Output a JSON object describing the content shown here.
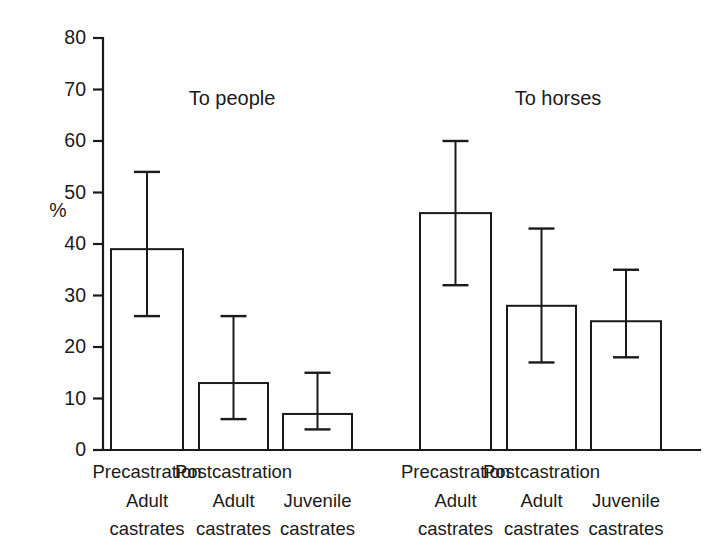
{
  "figure": {
    "background_color": "#ffffff",
    "line_color": "#1a1a1a",
    "bar_fill_color": "#ffffff",
    "width": 714,
    "height": 556
  },
  "axis": {
    "y_title": "%",
    "y_ticks": [
      "0",
      "10",
      "20",
      "30",
      "40",
      "50",
      "60",
      "70",
      "80"
    ],
    "y_min": 0,
    "y_max": 80,
    "y_tick_step": 10
  },
  "groups": [
    {
      "title": "To people"
    },
    {
      "title": "To horses"
    }
  ],
  "category_labels": [
    {
      "line1": "Precastration",
      "line2": "Adult",
      "line3": "castrates"
    },
    {
      "line1": "Postcastration",
      "line2": "Adult",
      "line3": "castrates"
    },
    {
      "line1": "",
      "line2": "Juvenile",
      "line3": "castrates"
    },
    {
      "line1": "Precastration",
      "line2": "Adult",
      "line3": "castrates"
    },
    {
      "line1": "Postcastration",
      "line2": "Adult",
      "line3": "castrates"
    },
    {
      "line1": "",
      "line2": "Juvenile",
      "line3": "castrates"
    }
  ],
  "chart_data": {
    "type": "bar",
    "title": "",
    "xlabel": "",
    "ylabel": "%",
    "ylim": [
      0,
      80
    ],
    "ytick_step": 10,
    "grid": false,
    "legend": "none",
    "error_bars": "asymmetric-range",
    "group_labels": [
      "To people",
      "To horses"
    ],
    "categories": [
      "Precastration Adult castrates",
      "Postcastration Adult castrates",
      "Juvenile castrates"
    ],
    "bars": [
      {
        "group": "To people",
        "category": "Precastration Adult castrates",
        "value": 39,
        "low": 26,
        "high": 54
      },
      {
        "group": "To people",
        "category": "Postcastration Adult castrates",
        "value": 13,
        "low": 6,
        "high": 26
      },
      {
        "group": "To people",
        "category": "Juvenile castrates",
        "value": 7,
        "low": 4,
        "high": 15
      },
      {
        "group": "To horses",
        "category": "Precastration Adult castrates",
        "value": 46,
        "low": 32,
        "high": 60
      },
      {
        "group": "To horses",
        "category": "Postcastration Adult castrates",
        "value": 28,
        "low": 17,
        "high": 43
      },
      {
        "group": "To horses",
        "category": "Juvenile castrates",
        "value": 25,
        "low": 18,
        "high": 35
      }
    ],
    "series": [
      {
        "name": "To people",
        "values": [
          39,
          13,
          7
        ],
        "low": [
          26,
          6,
          4
        ],
        "high": [
          54,
          26,
          15
        ]
      },
      {
        "name": "To horses",
        "values": [
          46,
          28,
          25
        ],
        "low": [
          32,
          17,
          18
        ],
        "high": [
          60,
          43,
          35
        ]
      }
    ]
  },
  "geometry": {
    "baseline_y": 450,
    "axis_top_y": 38,
    "axis_x": 103,
    "axis_right_x": 700,
    "tick_len": 10,
    "bar_span": [
      [
        111,
        183
      ],
      [
        199,
        268
      ],
      [
        283,
        352
      ],
      [
        420,
        491
      ],
      [
        507,
        576
      ],
      [
        591,
        661
      ]
    ],
    "group_title_x": [
      232,
      558
    ],
    "group_title_y": 100,
    "cat_label_rows_y": [
      473,
      502,
      530
    ]
  }
}
